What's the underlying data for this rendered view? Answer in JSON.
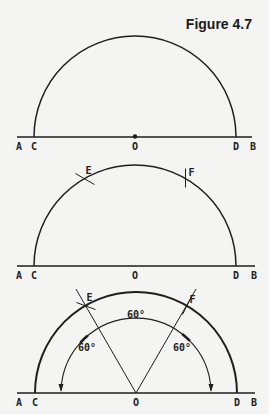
{
  "title": "Figure 4.7",
  "colors": {
    "ink": "#1e1e1e",
    "paper": "#f4f4f2"
  },
  "panels": [
    {
      "id": "step-1",
      "points": {
        "A": "A",
        "C": "C",
        "O": "O",
        "D": "D",
        "B": "B"
      },
      "center_dot": true,
      "arc_marks": [],
      "rays": [],
      "angles": []
    },
    {
      "id": "step-2",
      "points": {
        "A": "A",
        "C": "C",
        "O": "O",
        "D": "D",
        "B": "B"
      },
      "center_dot": false,
      "arc_marks": [
        {
          "label": "E",
          "angle_deg": 120
        },
        {
          "label": "F",
          "angle_deg": 60
        }
      ],
      "rays": [],
      "angles": []
    },
    {
      "id": "step-3",
      "points": {
        "A": "A",
        "C": "C",
        "O": "O",
        "D": "D",
        "B": "B"
      },
      "center_dot": false,
      "arc_marks": [
        {
          "label": "E",
          "angle_deg": 120
        },
        {
          "label": "F",
          "angle_deg": 60
        }
      ],
      "rays": [
        {
          "from": "O",
          "to": "E",
          "angle_deg": 120
        },
        {
          "from": "O",
          "to": "F",
          "angle_deg": 60
        }
      ],
      "angles": [
        {
          "label": "60°",
          "from_deg": 120,
          "to_deg": 180
        },
        {
          "label": "60°",
          "from_deg": 60,
          "to_deg": 120
        },
        {
          "label": "60°",
          "from_deg": 0,
          "to_deg": 60
        }
      ]
    }
  ]
}
